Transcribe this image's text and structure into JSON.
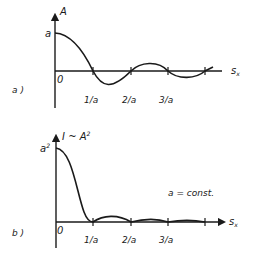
{
  "panels": [
    {
      "id": "a",
      "label": "a )",
      "y_axis_label": "A",
      "x_axis_label": "s",
      "x_axis_subscript": "x",
      "y_intercept_label": "a",
      "origin_label": "0",
      "ticks": [
        "1/a",
        "2/a",
        "3/a"
      ],
      "curve": "amplitude sinc"
    },
    {
      "id": "b",
      "label": "b )",
      "y_axis_label": "I ~ A",
      "y_axis_superscript": "2",
      "x_axis_label": "s",
      "x_axis_subscript": "x",
      "y_intercept_label": "a",
      "y_intercept_superscript": "2",
      "origin_label": "0",
      "ticks": [
        "1/a",
        "2/a",
        "3/a"
      ],
      "annotation": "a = const.",
      "curve": "intensity sinc squared"
    }
  ],
  "colors": {
    "ink": "#1a1a1a",
    "background": "#ffffff"
  }
}
